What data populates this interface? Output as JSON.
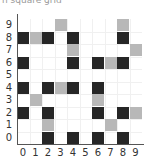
{
  "caption": "n square grid",
  "colors": {
    "black": "#262626",
    "gray": "#b8b8b8",
    "gridline": "#f0f0f0",
    "axis": "#555555"
  },
  "grid": {
    "cols": 10,
    "rows": 10,
    "x_labels": [
      "0",
      "1",
      "2",
      "3",
      "4",
      "5",
      "6",
      "7",
      "8",
      "9"
    ],
    "y_labels": [
      "0",
      "1",
      "2",
      "3",
      "4",
      "5",
      "6",
      "7",
      "8",
      "9"
    ],
    "cells": [
      {
        "col": 3,
        "row": 9,
        "color": "gray"
      },
      {
        "col": 8,
        "row": 9,
        "color": "gray"
      },
      {
        "col": 0,
        "row": 8,
        "color": "black"
      },
      {
        "col": 1,
        "row": 8,
        "color": "gray"
      },
      {
        "col": 2,
        "row": 8,
        "color": "black"
      },
      {
        "col": 4,
        "row": 8,
        "color": "black"
      },
      {
        "col": 8,
        "row": 8,
        "color": "black"
      },
      {
        "col": 4,
        "row": 7,
        "color": "gray"
      },
      {
        "col": 9,
        "row": 7,
        "color": "gray"
      },
      {
        "col": 0,
        "row": 6,
        "color": "black"
      },
      {
        "col": 4,
        "row": 6,
        "color": "black"
      },
      {
        "col": 6,
        "row": 6,
        "color": "black"
      },
      {
        "col": 7,
        "row": 6,
        "color": "gray"
      },
      {
        "col": 8,
        "row": 6,
        "color": "black"
      },
      {
        "col": 0,
        "row": 4,
        "color": "black"
      },
      {
        "col": 2,
        "row": 4,
        "color": "black"
      },
      {
        "col": 3,
        "row": 4,
        "color": "gray"
      },
      {
        "col": 4,
        "row": 4,
        "color": "black"
      },
      {
        "col": 6,
        "row": 4,
        "color": "black"
      },
      {
        "col": 1,
        "row": 3,
        "color": "gray"
      },
      {
        "col": 6,
        "row": 3,
        "color": "gray"
      },
      {
        "col": 0,
        "row": 2,
        "color": "black"
      },
      {
        "col": 2,
        "row": 2,
        "color": "black"
      },
      {
        "col": 6,
        "row": 2,
        "color": "black"
      },
      {
        "col": 8,
        "row": 2,
        "color": "black"
      },
      {
        "col": 9,
        "row": 2,
        "color": "gray"
      },
      {
        "col": 2,
        "row": 1,
        "color": "gray"
      },
      {
        "col": 7,
        "row": 1,
        "color": "gray"
      },
      {
        "col": 2,
        "row": 0,
        "color": "black"
      },
      {
        "col": 4,
        "row": 0,
        "color": "black"
      },
      {
        "col": 6,
        "row": 0,
        "color": "black"
      },
      {
        "col": 8,
        "row": 0,
        "color": "black"
      }
    ]
  }
}
